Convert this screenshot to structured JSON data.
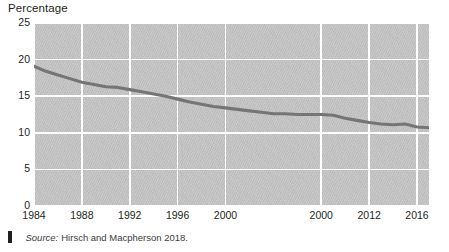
{
  "figure": {
    "axis_title": "Percentage",
    "source_marker": "vertical-bar-marker",
    "source_label": "Source:",
    "source_text": "Hirsch and Macpherson 2018."
  },
  "colors": {
    "plot_background": "#c6c6c6",
    "gridline": "#ffffff",
    "series_line": "#757575",
    "text": "#231f20",
    "source_text": "#3c3c3c"
  },
  "chart_data": {
    "type": "line",
    "title": "",
    "subtitle": "",
    "xlabel": "",
    "ylabel": "Percentage",
    "ylim": [
      0,
      25
    ],
    "xlim": [
      1984,
      2017
    ],
    "yticks": [
      "0",
      "5",
      "10",
      "15",
      "20",
      "25"
    ],
    "ytick_values": [
      0,
      5,
      10,
      15,
      20,
      25
    ],
    "xticks": [
      "1984",
      "1988",
      "1992",
      "1996",
      "2000",
      "2000",
      "2012",
      "2016"
    ],
    "xtick_values": [
      1984,
      1988,
      1992,
      1996,
      2000,
      2008,
      2012,
      2016
    ],
    "grid": true,
    "legend": "none",
    "series": [
      {
        "name": "Percentage",
        "color": "#757575",
        "x": [
          1984,
          1985,
          1986,
          1987,
          1988,
          1989,
          1990,
          1991,
          1992,
          1993,
          1994,
          1995,
          1996,
          1997,
          1998,
          1999,
          2000,
          2001,
          2002,
          2003,
          2004,
          2005,
          2006,
          2007,
          2008,
          2009,
          2010,
          2011,
          2012,
          2013,
          2014,
          2015,
          2016,
          2017
        ],
        "values": [
          19.1,
          18.4,
          17.9,
          17.4,
          16.9,
          16.6,
          16.3,
          16.2,
          15.9,
          15.6,
          15.3,
          15.0,
          14.6,
          14.2,
          13.9,
          13.6,
          13.4,
          13.2,
          13.0,
          12.8,
          12.6,
          12.6,
          12.5,
          12.5,
          12.5,
          12.4,
          12.0,
          11.7,
          11.4,
          11.2,
          11.1,
          11.2,
          10.8,
          10.7
        ]
      }
    ]
  }
}
